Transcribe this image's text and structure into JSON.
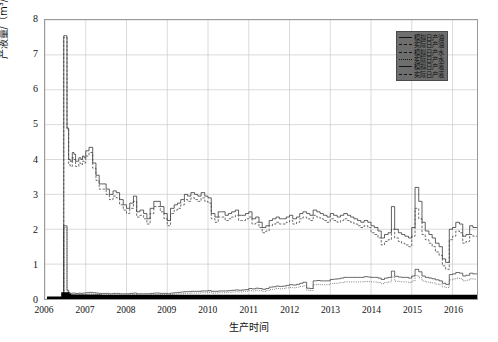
{
  "axes": {
    "ylabel": "产液量/（m³/d）",
    "xlabel": "生产时间",
    "yticks": [
      "0",
      "1",
      "2",
      "3",
      "4",
      "5",
      "6",
      "7",
      "8"
    ],
    "xticks": [
      "2006",
      "2007",
      "2008",
      "2009",
      "2010",
      "2011",
      "2012",
      "2013",
      "2014",
      "2015",
      "2016"
    ]
  },
  "legend": {
    "items": [
      {
        "label": "模拟日产油",
        "style": "thick"
      },
      {
        "label": "实际日产油",
        "style": "dash"
      },
      {
        "label": "模拟日产水",
        "style": "dash"
      },
      {
        "label": "实际日产水",
        "style": "dot"
      },
      {
        "label": "模拟日产液",
        "style": "thick"
      },
      {
        "label": "实际日产液",
        "style": "dash"
      }
    ]
  },
  "chart_data": {
    "type": "line",
    "title": "",
    "xlabel": "生产时间",
    "ylabel": "产液量/（m³/d）",
    "xlim": [
      2006.0,
      2016.6
    ],
    "ylim": [
      0,
      8
    ],
    "grid": true,
    "legend_position": "top-right",
    "x": [
      2006.05,
      2006.15,
      2006.25,
      2006.35,
      2006.42,
      2006.46,
      2006.5,
      2006.54,
      2006.58,
      2006.62,
      2006.67,
      2006.71,
      2006.75,
      2006.79,
      2006.83,
      2006.88,
      2006.92,
      2006.96,
      2007.0,
      2007.08,
      2007.17,
      2007.25,
      2007.33,
      2007.42,
      2007.5,
      2007.58,
      2007.67,
      2007.75,
      2007.83,
      2007.92,
      2008.0,
      2008.08,
      2008.17,
      2008.25,
      2008.33,
      2008.42,
      2008.5,
      2008.58,
      2008.67,
      2008.75,
      2008.83,
      2008.92,
      2009.0,
      2009.08,
      2009.17,
      2009.25,
      2009.33,
      2009.42,
      2009.5,
      2009.58,
      2009.67,
      2009.75,
      2009.83,
      2009.92,
      2010.0,
      2010.08,
      2010.17,
      2010.25,
      2010.33,
      2010.42,
      2010.5,
      2010.58,
      2010.67,
      2010.75,
      2010.83,
      2010.92,
      2011.0,
      2011.08,
      2011.17,
      2011.25,
      2011.33,
      2011.42,
      2011.5,
      2011.58,
      2011.67,
      2011.75,
      2011.83,
      2011.92,
      2012.0,
      2012.08,
      2012.17,
      2012.25,
      2012.33,
      2012.42,
      2012.5,
      2012.58,
      2012.67,
      2012.75,
      2012.83,
      2012.92,
      2013.0,
      2013.08,
      2013.17,
      2013.25,
      2013.33,
      2013.42,
      2013.5,
      2013.58,
      2013.67,
      2013.75,
      2013.83,
      2013.92,
      2014.0,
      2014.08,
      2014.17,
      2014.25,
      2014.33,
      2014.42,
      2014.5,
      2014.58,
      2014.67,
      2014.75,
      2014.83,
      2014.92,
      2015.0,
      2015.08,
      2015.17,
      2015.25,
      2015.33,
      2015.42,
      2015.5,
      2015.58,
      2015.67,
      2015.75,
      2015.83,
      2015.92,
      2016.0,
      2016.08,
      2016.17,
      2016.25,
      2016.33,
      2016.42,
      2016.5
    ],
    "series": [
      {
        "name": "模拟日产液",
        "style": "solid",
        "values": [
          0,
          0,
          0,
          0,
          0,
          7.55,
          7.55,
          4.9,
          4.0,
          3.95,
          4.2,
          4.15,
          3.95,
          3.95,
          4.05,
          4.0,
          4.1,
          4.05,
          4.25,
          4.35,
          3.9,
          3.55,
          3.3,
          3.3,
          3.15,
          3.0,
          3.1,
          3.05,
          2.85,
          2.7,
          2.6,
          2.75,
          2.95,
          2.5,
          2.55,
          2.45,
          2.3,
          2.6,
          2.8,
          2.8,
          2.65,
          2.45,
          2.25,
          2.6,
          2.7,
          2.75,
          2.85,
          3.0,
          2.95,
          3.05,
          3.0,
          2.95,
          3.05,
          2.95,
          2.9,
          2.45,
          2.35,
          2.5,
          2.5,
          2.4,
          2.45,
          2.5,
          2.55,
          2.4,
          2.4,
          2.45,
          2.5,
          2.3,
          2.35,
          2.2,
          2.05,
          2.1,
          2.25,
          2.3,
          2.35,
          2.3,
          2.3,
          2.35,
          2.4,
          2.3,
          2.35,
          2.45,
          2.5,
          2.45,
          2.4,
          2.55,
          2.5,
          2.45,
          2.4,
          2.35,
          2.45,
          2.4,
          2.35,
          2.4,
          2.45,
          2.4,
          2.35,
          2.3,
          2.25,
          2.2,
          2.25,
          2.2,
          2.1,
          2.05,
          1.95,
          1.75,
          1.85,
          1.9,
          2.65,
          2.0,
          1.9,
          1.85,
          1.8,
          1.75,
          2.05,
          3.2,
          2.8,
          2.2,
          1.95,
          1.85,
          1.75,
          1.6,
          1.5,
          1.15,
          1.05,
          2.0,
          2.05,
          2.2,
          2.15,
          1.8,
          1.85,
          2.1,
          2.05
        ]
      },
      {
        "name": "实际日产液",
        "style": "dashed",
        "values": [
          0,
          0,
          0,
          0,
          0,
          7.5,
          7.5,
          4.85,
          3.85,
          3.8,
          4.05,
          4.0,
          3.8,
          3.8,
          3.9,
          3.85,
          3.95,
          3.9,
          4.1,
          4.2,
          3.75,
          3.4,
          3.15,
          3.15,
          3.0,
          2.85,
          2.95,
          2.9,
          2.7,
          2.55,
          2.45,
          2.6,
          2.8,
          2.35,
          2.4,
          2.3,
          2.15,
          2.45,
          2.65,
          2.65,
          2.5,
          2.3,
          2.1,
          2.45,
          2.55,
          2.6,
          2.7,
          2.85,
          2.8,
          2.9,
          2.85,
          2.8,
          2.9,
          2.8,
          2.75,
          2.3,
          2.2,
          2.35,
          2.35,
          2.25,
          2.3,
          2.35,
          2.4,
          2.25,
          2.25,
          2.3,
          2.35,
          2.15,
          2.2,
          2.05,
          1.9,
          1.95,
          2.1,
          2.15,
          2.2,
          2.15,
          2.15,
          2.2,
          2.25,
          2.15,
          2.2,
          2.3,
          2.35,
          2.3,
          2.25,
          2.4,
          2.35,
          2.3,
          2.25,
          2.2,
          2.3,
          2.25,
          2.2,
          2.25,
          2.3,
          2.25,
          2.2,
          2.15,
          2.1,
          2.05,
          2.1,
          2.05,
          1.9,
          1.85,
          1.75,
          1.55,
          1.65,
          1.7,
          2.0,
          1.75,
          1.65,
          1.6,
          1.55,
          1.5,
          1.8,
          2.6,
          2.3,
          1.85,
          1.7,
          1.6,
          1.5,
          1.35,
          1.25,
          0.95,
          0.85,
          1.7,
          1.8,
          1.95,
          1.9,
          1.6,
          1.65,
          1.85,
          1.8
        ]
      },
      {
        "name": "模拟日产水",
        "style": "solid-thin",
        "values": [
          0,
          0,
          0,
          0,
          0,
          2.1,
          2.1,
          0.25,
          0.18,
          0.16,
          0.17,
          0.17,
          0.16,
          0.16,
          0.17,
          0.16,
          0.17,
          0.17,
          0.18,
          0.19,
          0.18,
          0.17,
          0.16,
          0.16,
          0.16,
          0.15,
          0.16,
          0.16,
          0.15,
          0.15,
          0.15,
          0.16,
          0.17,
          0.15,
          0.15,
          0.15,
          0.15,
          0.16,
          0.17,
          0.17,
          0.16,
          0.16,
          0.15,
          0.17,
          0.18,
          0.19,
          0.2,
          0.21,
          0.21,
          0.22,
          0.22,
          0.22,
          0.23,
          0.23,
          0.24,
          0.22,
          0.22,
          0.23,
          0.23,
          0.23,
          0.24,
          0.25,
          0.26,
          0.25,
          0.26,
          0.27,
          0.3,
          0.29,
          0.31,
          0.3,
          0.28,
          0.3,
          0.34,
          0.35,
          0.37,
          0.36,
          0.37,
          0.39,
          0.41,
          0.4,
          0.42,
          0.45,
          0.48,
          0.31,
          0.3,
          0.52,
          0.53,
          0.52,
          0.52,
          0.52,
          0.56,
          0.57,
          0.58,
          0.6,
          0.62,
          0.62,
          0.62,
          0.62,
          0.62,
          0.62,
          0.64,
          0.63,
          0.62,
          0.62,
          0.6,
          0.56,
          0.6,
          0.62,
          0.8,
          0.65,
          0.63,
          0.62,
          0.62,
          0.6,
          0.66,
          0.85,
          0.78,
          0.66,
          0.62,
          0.6,
          0.58,
          0.55,
          0.52,
          0.45,
          0.42,
          0.7,
          0.72,
          0.76,
          0.74,
          0.66,
          0.68,
          0.74,
          0.72
        ]
      },
      {
        "name": "实际日产水",
        "style": "dotted",
        "values": [
          0,
          0,
          0,
          0,
          0,
          2.05,
          2.05,
          0.2,
          0.14,
          0.12,
          0.13,
          0.13,
          0.12,
          0.12,
          0.13,
          0.12,
          0.13,
          0.13,
          0.14,
          0.15,
          0.14,
          0.13,
          0.12,
          0.12,
          0.12,
          0.11,
          0.12,
          0.12,
          0.11,
          0.11,
          0.11,
          0.12,
          0.13,
          0.11,
          0.11,
          0.11,
          0.11,
          0.12,
          0.13,
          0.13,
          0.12,
          0.12,
          0.11,
          0.13,
          0.14,
          0.15,
          0.15,
          0.16,
          0.16,
          0.17,
          0.17,
          0.17,
          0.18,
          0.18,
          0.19,
          0.17,
          0.17,
          0.18,
          0.18,
          0.18,
          0.19,
          0.2,
          0.21,
          0.2,
          0.21,
          0.22,
          0.24,
          0.23,
          0.25,
          0.24,
          0.22,
          0.24,
          0.27,
          0.28,
          0.3,
          0.29,
          0.3,
          0.32,
          0.33,
          0.32,
          0.34,
          0.36,
          0.38,
          0.25,
          0.24,
          0.41,
          0.42,
          0.41,
          0.41,
          0.41,
          0.44,
          0.45,
          0.46,
          0.47,
          0.49,
          0.49,
          0.49,
          0.49,
          0.49,
          0.49,
          0.5,
          0.5,
          0.49,
          0.49,
          0.47,
          0.44,
          0.47,
          0.49,
          0.63,
          0.51,
          0.5,
          0.49,
          0.49,
          0.47,
          0.52,
          0.67,
          0.61,
          0.52,
          0.49,
          0.47,
          0.46,
          0.43,
          0.41,
          0.35,
          0.33,
          0.55,
          0.57,
          0.6,
          0.58,
          0.52,
          0.54,
          0.58,
          0.57
        ]
      },
      {
        "name": "模拟日产油",
        "style": "thick-black",
        "values": [
          0,
          0,
          0,
          0,
          0,
          0.12,
          0.12,
          0.08,
          0.06,
          0.06,
          0.06,
          0.06,
          0.06,
          0.06,
          0.06,
          0.06,
          0.06,
          0.06,
          0.06,
          0.06,
          0.06,
          0.06,
          0.05,
          0.05,
          0.05,
          0.05,
          0.05,
          0.05,
          0.05,
          0.05,
          0.05,
          0.05,
          0.05,
          0.05,
          0.05,
          0.05,
          0.05,
          0.05,
          0.05,
          0.05,
          0.05,
          0.05,
          0.05,
          0.05,
          0.05,
          0.05,
          0.05,
          0.05,
          0.05,
          0.05,
          0.05,
          0.05,
          0.05,
          0.05,
          0.05,
          0.05,
          0.05,
          0.05,
          0.05,
          0.05,
          0.05,
          0.05,
          0.05,
          0.05,
          0.05,
          0.05,
          0.05,
          0.05,
          0.05,
          0.05,
          0.05,
          0.05,
          0.05,
          0.05,
          0.05,
          0.05,
          0.05,
          0.05,
          0.05,
          0.05,
          0.05,
          0.05,
          0.05,
          0.05,
          0.05,
          0.05,
          0.05,
          0.05,
          0.05,
          0.05,
          0.05,
          0.05,
          0.05,
          0.05,
          0.05,
          0.05,
          0.05,
          0.05,
          0.05,
          0.05,
          0.05,
          0.05,
          0.05,
          0.05,
          0.05,
          0.05,
          0.05,
          0.05,
          0.05,
          0.05,
          0.05,
          0.05,
          0.05,
          0.05,
          0.05,
          0.05,
          0.05,
          0.05,
          0.05,
          0.05,
          0.05,
          0.05,
          0.05,
          0.05,
          0.05,
          0.05,
          0.05,
          0.05,
          0.05,
          0.05,
          0.05,
          0.05,
          0.05
        ]
      },
      {
        "name": "实际日产油",
        "style": "thick-black-2",
        "values": [
          0,
          0,
          0,
          0,
          0,
          0.1,
          0.1,
          0.06,
          0.04,
          0.04,
          0.04,
          0.04,
          0.04,
          0.04,
          0.04,
          0.04,
          0.04,
          0.04,
          0.04,
          0.04,
          0.04,
          0.04,
          0.04,
          0.04,
          0.04,
          0.04,
          0.04,
          0.04,
          0.04,
          0.04,
          0.04,
          0.04,
          0.04,
          0.04,
          0.04,
          0.04,
          0.04,
          0.04,
          0.04,
          0.04,
          0.04,
          0.04,
          0.04,
          0.04,
          0.04,
          0.04,
          0.04,
          0.04,
          0.04,
          0.04,
          0.04,
          0.04,
          0.04,
          0.04,
          0.04,
          0.04,
          0.04,
          0.04,
          0.04,
          0.04,
          0.04,
          0.04,
          0.04,
          0.04,
          0.04,
          0.04,
          0.04,
          0.04,
          0.04,
          0.04,
          0.04,
          0.04,
          0.04,
          0.04,
          0.04,
          0.04,
          0.04,
          0.04,
          0.04,
          0.04,
          0.04,
          0.04,
          0.04,
          0.04,
          0.04,
          0.04,
          0.04,
          0.04,
          0.04,
          0.04,
          0.04,
          0.04,
          0.04,
          0.04,
          0.04,
          0.04,
          0.04,
          0.04,
          0.04,
          0.04,
          0.04,
          0.04,
          0.04,
          0.04,
          0.04,
          0.04,
          0.04,
          0.04,
          0.04,
          0.04,
          0.04,
          0.04,
          0.04,
          0.04,
          0.04,
          0.04,
          0.04,
          0.04,
          0.04,
          0.04,
          0.04,
          0.04,
          0.04,
          0.04,
          0.04,
          0.04,
          0.04,
          0.04,
          0.04,
          0.04,
          0.04,
          0.04,
          0.04
        ]
      }
    ]
  }
}
